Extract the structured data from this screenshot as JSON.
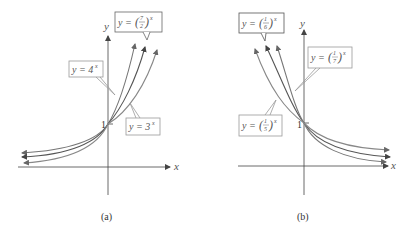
{
  "figure": {
    "panels": [
      {
        "id": "a",
        "caption": "(a)",
        "x_axis_label": "x",
        "y_axis_label": "y",
        "intercept_label": "1",
        "curves": [
          {
            "name": "4^x",
            "label_prefix": "y = 4",
            "label_exp": "x",
            "color": "#777777"
          },
          {
            "name": "(7/2)^x",
            "label_prefix": "y = ",
            "label_num": "7",
            "label_den": "2",
            "label_exp": "x",
            "color": "#555555"
          },
          {
            "name": "3^x",
            "label_prefix": "y = 3",
            "label_exp": "x",
            "color": "#888888"
          }
        ]
      },
      {
        "id": "b",
        "caption": "(b)",
        "x_axis_label": "x",
        "y_axis_label": "y",
        "intercept_label": "1",
        "curves": [
          {
            "name": "(1/6)^x",
            "label_prefix": "y = ",
            "label_num": "1",
            "label_den": "6",
            "label_exp": "x",
            "color": "#555555"
          },
          {
            "name": "(1/7)^x",
            "label_prefix": "y = ",
            "label_num": "1",
            "label_den": "7",
            "label_exp": "x",
            "color": "#777777"
          },
          {
            "name": "(1/5)^x",
            "label_prefix": "y = ",
            "label_num": "1",
            "label_den": "5",
            "label_exp": "x",
            "color": "#888888"
          }
        ]
      }
    ]
  }
}
